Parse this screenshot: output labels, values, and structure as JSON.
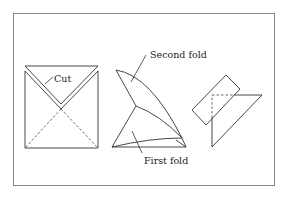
{
  "diagram": {
    "colors": {
      "line": "#333333",
      "frame": "#888888",
      "background": "#ffffff"
    },
    "labels": {
      "cut": "Cut",
      "second_fold": "Second fold",
      "first_fold": "First fold"
    },
    "panels": [
      {
        "name": "square-with-cuts",
        "description": "Square with dashed diagonals and V-shaped cut strip"
      },
      {
        "name": "folded-shape",
        "description": "Curved folded shape showing first and second folds"
      },
      {
        "name": "rotated-strip",
        "description": "Triangle with overlapping rotated rectangular strip"
      }
    ]
  }
}
